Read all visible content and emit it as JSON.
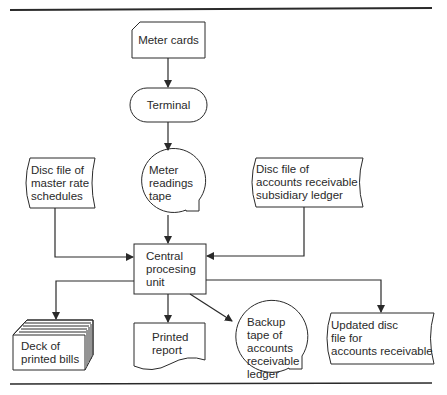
{
  "diagram": {
    "type": "system-flowchart",
    "nodes": [
      {
        "id": "meter-cards",
        "shape": "punched-card",
        "label": "Meter cards"
      },
      {
        "id": "terminal",
        "shape": "terminal",
        "label": "Terminal"
      },
      {
        "id": "meter-readings-tape",
        "shape": "magnetic-tape",
        "label": "Meter\nreadings\ntape"
      },
      {
        "id": "master-rate-disc",
        "shape": "online-storage",
        "label": "Disc file of\nmaster rate\nschedules"
      },
      {
        "id": "ar-subsidiary-disc",
        "shape": "online-storage",
        "label": "Disc file of\naccounts receivable\nsubsidiary ledger"
      },
      {
        "id": "cpu",
        "shape": "process",
        "label": "Central\nprocesing\nunit"
      },
      {
        "id": "printed-bills",
        "shape": "card-deck",
        "label": "Deck of\nprinted bills"
      },
      {
        "id": "printed-report",
        "shape": "document",
        "label": "Printed\nreport"
      },
      {
        "id": "backup-tape",
        "shape": "magnetic-tape",
        "label": "Backup\ntape of\naccounts\nreceivable\nledger"
      },
      {
        "id": "updated-ar-disc",
        "shape": "online-storage",
        "label": "Updated disc\nfile for\naccounts receivable"
      }
    ],
    "edges": [
      {
        "from": "meter-cards",
        "to": "terminal"
      },
      {
        "from": "terminal",
        "to": "meter-readings-tape"
      },
      {
        "from": "meter-readings-tape",
        "to": "cpu"
      },
      {
        "from": "master-rate-disc",
        "to": "cpu"
      },
      {
        "from": "ar-subsidiary-disc",
        "to": "cpu"
      },
      {
        "from": "cpu",
        "to": "printed-bills"
      },
      {
        "from": "cpu",
        "to": "printed-report"
      },
      {
        "from": "cpu",
        "to": "backup-tape"
      },
      {
        "from": "cpu",
        "to": "updated-ar-disc"
      }
    ]
  },
  "labels": {
    "meter_cards": "Meter cards",
    "terminal": "Terminal",
    "meter_tape": "Meter\nreadings\ntape",
    "master_disc": "Disc file of\nmaster rate\nschedules",
    "ar_disc": "Disc file of\naccounts receivable\nsubsidiary ledger",
    "cpu": "Central\nprocesing\nunit",
    "bills": "Deck of\nprinted bills",
    "report": "Printed\nreport",
    "backup": "Backup\ntape of\naccounts\nreceivable\nledger",
    "updated_disc": "Updated disc\nfile for\naccounts receivable"
  },
  "colors": {
    "line": "#2a2a2a",
    "background": "#ffffff"
  }
}
